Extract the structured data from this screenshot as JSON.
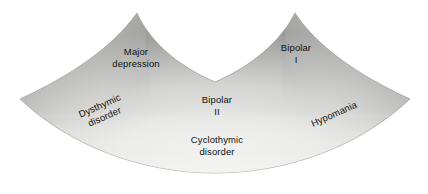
{
  "figure": {
    "name": "bipolar-spectrum-diagram",
    "background_color": "#ffffff",
    "shape": {
      "name": "spectrum-fan-shape",
      "description": "two-peaked fan with central valley and downward-bulging base",
      "fill_light": "#ebebe9",
      "fill_mid": "#bcbcba",
      "fill_dark": "#989896",
      "edge_color": "#8f8f8d"
    },
    "labels": [
      {
        "id": "major-depression",
        "text": "Major\ndepression",
        "x": 136,
        "y": 57,
        "rotation": 0
      },
      {
        "id": "bipolar-i",
        "text": "Bipolar\nI",
        "x": 296,
        "y": 53,
        "rotation": 0
      },
      {
        "id": "dysthymic-disorder",
        "text": "Dysthymic\ndisorder",
        "x": 102,
        "y": 111,
        "rotation": -24
      },
      {
        "id": "bipolar-ii",
        "text": "Bipolar\nII",
        "x": 217,
        "y": 105,
        "rotation": 0
      },
      {
        "id": "hypomania",
        "text": "Hypomania",
        "x": 334,
        "y": 114,
        "rotation": -24
      },
      {
        "id": "cyclothymic-disorder",
        "text": "Cyclothymic\ndisorder",
        "x": 217,
        "y": 145,
        "rotation": 0
      }
    ]
  }
}
